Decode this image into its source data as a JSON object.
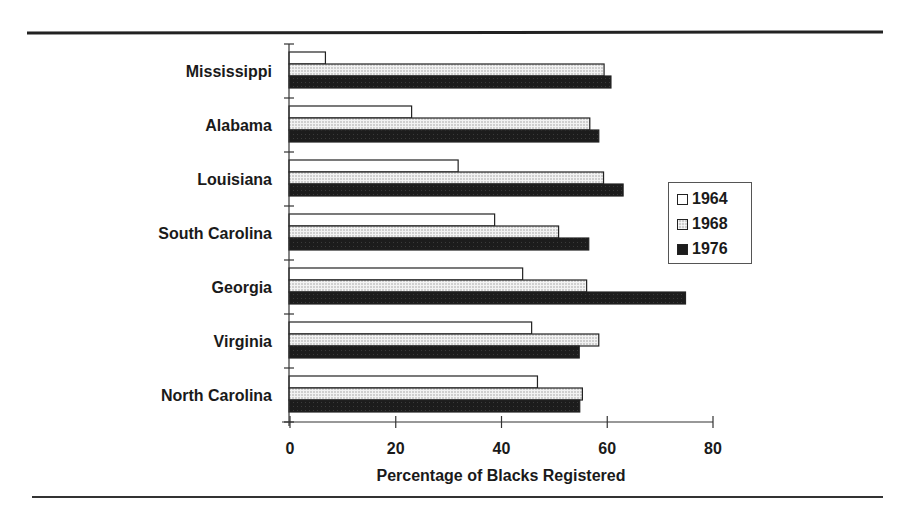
{
  "chart_data": {
    "type": "bar",
    "orientation": "horizontal",
    "title": "",
    "xlabel": "Percentage of Blacks Registered",
    "ylabel": "",
    "xlim": [
      0,
      80
    ],
    "x_ticks": [
      0,
      20,
      40,
      60,
      80
    ],
    "grid": false,
    "legend_position": "right",
    "categories": [
      "Mississippi",
      "Alabama",
      "Louisiana",
      "South Carolina",
      "Georgia",
      "Virginia",
      "North Carolina"
    ],
    "series": [
      {
        "name": "1964",
        "fill": "white",
        "values": [
          6.7,
          23.0,
          31.8,
          38.7,
          44.0,
          45.7,
          46.8
        ]
      },
      {
        "name": "1968",
        "fill": "light gray pattern",
        "values": [
          59.4,
          56.7,
          59.3,
          50.8,
          56.1,
          58.4,
          55.3
        ]
      },
      {
        "name": "1976",
        "fill": "black",
        "values": [
          60.7,
          58.4,
          63.0,
          56.5,
          74.8,
          54.7,
          54.8
        ]
      }
    ]
  },
  "axis": {
    "ticks": [
      "0",
      "20",
      "40",
      "60",
      "80"
    ],
    "title": "Percentage of Blacks Registered"
  },
  "legend": {
    "items": [
      {
        "label": "1964"
      },
      {
        "label": "1968"
      },
      {
        "label": "1976"
      }
    ]
  },
  "colors": {
    "s1964": "#ffffff",
    "s1968": "#cfcfcf",
    "s1976": "#1c1c1c",
    "axis": "#333333"
  }
}
